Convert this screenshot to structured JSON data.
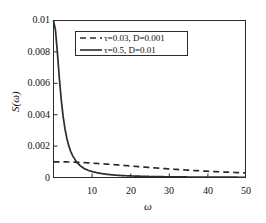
{
  "chart_data": {
    "type": "line",
    "title": "",
    "xlabel": "ω",
    "ylabel": "S(ω)",
    "xlim": [
      0,
      50
    ],
    "ylim": [
      0,
      0.01
    ],
    "xticks": [
      10,
      20,
      30,
      40,
      50
    ],
    "xticklabels": [
      "10",
      "20",
      "30",
      "40",
      "50"
    ],
    "yticks": [
      0,
      0.002,
      0.004,
      0.006,
      0.008,
      0.01
    ],
    "yticklabels": [
      "0",
      "0.002",
      "0.004",
      "0.006",
      "0.008",
      "0.01"
    ],
    "grid": false,
    "legend_position": "upper center",
    "frame": "box",
    "tick_direction": "in",
    "series": [
      {
        "name": "τ=0.03, D=0.001",
        "label_tau": "τ=0.03",
        "label_D": "D=0.001",
        "tau": 0.03,
        "D": 0.001,
        "style": "dashed",
        "color": "#2b2b2b",
        "x": [
          0,
          1,
          2,
          3,
          4,
          5,
          6,
          7,
          8,
          9,
          10,
          12,
          14,
          16,
          18,
          20,
          22,
          25,
          28,
          30,
          33,
          36,
          40,
          43,
          46,
          50
        ],
        "y": [
          0.001,
          0.000999,
          0.000996,
          0.000992,
          0.000986,
          0.000978,
          0.000968,
          0.000957,
          0.000945,
          0.000932,
          0.000917,
          0.000885,
          0.00085,
          0.000813,
          0.000775,
          0.000735,
          0.000696,
          0.000638,
          0.000583,
          0.000548,
          0.000499,
          0.000454,
          0.0004,
          0.000364,
          0.000331,
          0.000292
        ]
      },
      {
        "name": "τ=0.5, D=0.01",
        "label_tau": "τ=0.5",
        "label_D": "D=0.01",
        "tau": 0.5,
        "D": 0.01,
        "style": "solid",
        "color": "#2b2b2b",
        "x": [
          0,
          0.5,
          1,
          1.5,
          2,
          2.5,
          3,
          3.5,
          4,
          4.5,
          5,
          6,
          7,
          8,
          9,
          10,
          12,
          14,
          16,
          18,
          20,
          25,
          30,
          35,
          40,
          45,
          50
        ],
        "y": [
          0.01,
          0.00941,
          0.008,
          0.0064,
          0.005,
          0.0039,
          0.00308,
          0.00247,
          0.002,
          0.00165,
          0.00138,
          0.00099,
          0.00074,
          0.00057,
          0.00046,
          0.00038,
          0.00027,
          0.0002,
          0.00015,
          0.00012,
          0.0001,
          6.4e-05,
          4.4e-05,
          3.3e-05,
          2.5e-05,
          2e-05,
          1.6e-05
        ]
      }
    ]
  },
  "axes": {
    "ylabel_display": "S(ω)",
    "xlabel_display": "ω"
  }
}
